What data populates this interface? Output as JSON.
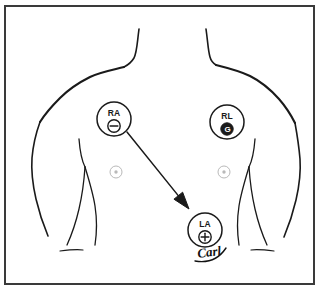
{
  "figure": {
    "medium": "hand-drawn ink sketch",
    "background_color": "#ffffff",
    "ink_color": "#1a1a1a",
    "faint_ink_color": "#b9b9b9",
    "border": {
      "present": true,
      "color": "#3a3a3a",
      "x": 5,
      "y": 6,
      "width": 309,
      "height": 278,
      "stroke_width": 2
    }
  },
  "electrodes": [
    {
      "id": "ra",
      "label": "RA",
      "polarity_symbol": "minus",
      "polarity_glyph": "⊖",
      "description": "Right arm electrode, negative",
      "cx": 114,
      "cy": 119,
      "r": 17,
      "filled": false
    },
    {
      "id": "rl",
      "label": "RL",
      "polarity_symbol": "ground",
      "polarity_glyph": "G",
      "description": "Right leg electrode, ground",
      "cx": 227,
      "cy": 122,
      "r": 17,
      "filled": true
    },
    {
      "id": "la",
      "label": "LA",
      "polarity_symbol": "plus",
      "polarity_glyph": "⊕",
      "description": "Left arm electrode, positive",
      "cx": 205,
      "cy": 230,
      "r": 17,
      "filled": false
    }
  ],
  "arrow": {
    "id": "ra-to-la-arrow",
    "description": "Arrow pointing from RA electrode down toward LA electrode",
    "from_x": 127,
    "from_y": 132,
    "to_x": 189,
    "to_y": 209,
    "head_size": 9,
    "color": "#1a1a1a"
  },
  "nipple_marks": [
    {
      "id": "left-nipple-mark",
      "cx": 116,
      "cy": 172,
      "r": 6
    },
    {
      "id": "right-nipple-mark",
      "cx": 224,
      "cy": 172,
      "r": 6
    }
  ],
  "signature": {
    "id": "artist-signature",
    "text": "Carl",
    "x": 198,
    "y": 258,
    "rotation": -8
  },
  "anatomy_paths": {
    "neck_left": "M 139 29 C 137 44 137 52 134 58 C 131 63 128 65 124 67",
    "neck_right": "M 206 29 C 208 43 208 50 210 57 C 211 61 213 63 216 65",
    "shoulder_left": "M 124 67 C 112 70 100 72 90 77 C 78 83 68 90 60 98 C 52 106 45 114 40 122",
    "shoulder_right": "M 216 65 C 228 68 240 71 250 76 C 262 82 271 90 279 99 C 286 107 291 115 295 123",
    "side_left": "M 40 122 C 36 133 33 146 32 158 C 31 172 33 186 36 199 C 39 212 43 224 48 236",
    "side_right": "M 295 123 C 297 134 299 147 300 159 C 301 173 299 187 296 200 C 293 213 289 225 284 237",
    "pec_left": "M 79 139 C 80 152 82 161 85 167",
    "pec_right": "M 255 139 C 254 152 252 161 249 167",
    "armcrease_left": "M 85 167 C 84 182 82 196 79 209 C 76 222 72 234 67 245",
    "armcrease_right": "M 249 167 C 250 182 252 196 255 209 C 258 222 262 234 267 245",
    "torso_inner_left": "M 85 167 C 89 180 93 193 95 206 C 97 219 97 232 95 245",
    "torso_inner_right": "M 249 167 C 245 180 241 193 239 206 C 237 219 237 232 239 245",
    "hip_left": "M 60 251 C 68 250 76 249 83 250",
    "hip_right": "M 274 251 C 266 250 258 249 251 250"
  },
  "a11y": {
    "caption": "Hand-drawn anterior torso diagram showing ECG electrode placement: RA (negative) on the upper right chest, RL (ground) on the upper left chest, and LA (positive) on the lower left chest, with an arrow indicating lead vector from RA to LA."
  }
}
